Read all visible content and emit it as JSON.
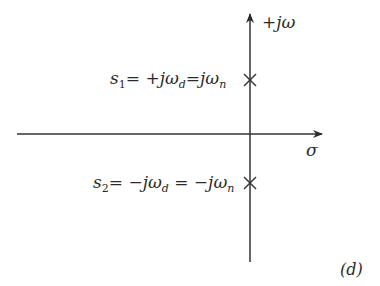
{
  "diagram": {
    "type": "s-plane pole plot",
    "axes": {
      "imag_label": "+jω",
      "real_label": "σ"
    },
    "poles": [
      {
        "name": "s1",
        "var": "s",
        "sub": "1",
        "eq1_prefix": "= +jω",
        "eq1_sub": "d",
        "eq2_prefix": "=jω",
        "eq2_sub": "n",
        "marker": "×"
      },
      {
        "name": "s2",
        "var": "s",
        "sub": "2",
        "eq1_prefix": "= −jω",
        "eq1_sub": "d",
        "eq2_prefix": " = −jω",
        "eq2_sub": "n",
        "marker": "×"
      }
    ],
    "panel_label": "(d)"
  }
}
